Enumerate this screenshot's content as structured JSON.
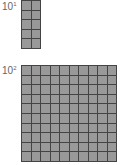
{
  "blocks": [
    {
      "label_base": "10",
      "label_exp": "1",
      "cols": 2,
      "rows": 5,
      "fill": "#999999",
      "line": "#444444"
    },
    {
      "label_base": "10",
      "label_exp": "2",
      "cols": 10,
      "rows": 10,
      "fill": "#999999",
      "line": "#444444"
    }
  ]
}
